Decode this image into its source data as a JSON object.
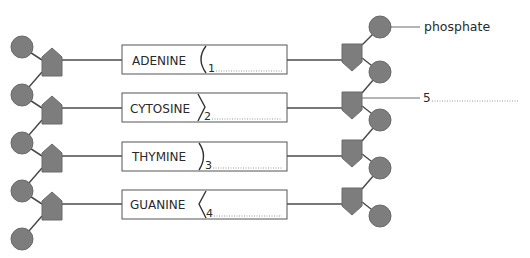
{
  "diagram": {
    "colors": {
      "shape_fill": "#7d7d7d",
      "shape_stroke": "#6a6a6a",
      "line": "#4a4a4a",
      "box_stroke": "#555555",
      "text": "#2a2a2a",
      "dots": "#9a9a9a"
    },
    "bases": [
      {
        "name": "ADENINE",
        "number": "1",
        "notch": "curve-open"
      },
      {
        "name": "CYTOSINE",
        "number": "2",
        "notch": "chevron-right"
      },
      {
        "name": "THYMINE",
        "number": "3",
        "notch": "curve-close"
      },
      {
        "name": "GUANINE",
        "number": "4",
        "notch": "chevron-left"
      }
    ],
    "labels": {
      "phosphate": "phosphate",
      "label5": "5"
    },
    "legend_parts": {
      "circle": "phosphate-group",
      "pentagon": "sugar (deoxyribose)",
      "rectangle": "nitrogenous base"
    }
  }
}
